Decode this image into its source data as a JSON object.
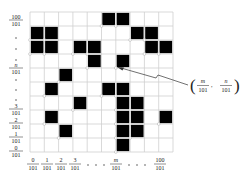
{
  "diagram": {
    "title": "",
    "grid": {
      "rows": 10,
      "cols": 10,
      "line_color": "#cfcfcf",
      "fill_color": "#000000"
    },
    "filled_cells": [
      [
        0,
        5
      ],
      [
        0,
        6
      ],
      [
        1,
        0
      ],
      [
        1,
        1
      ],
      [
        1,
        7
      ],
      [
        1,
        8
      ],
      [
        2,
        0
      ],
      [
        2,
        1
      ],
      [
        2,
        3
      ],
      [
        2,
        4
      ],
      [
        2,
        8
      ],
      [
        2,
        9
      ],
      [
        3,
        4
      ],
      [
        3,
        6
      ],
      [
        4,
        2
      ],
      [
        5,
        1
      ],
      [
        5,
        5
      ],
      [
        5,
        6
      ],
      [
        6,
        3
      ],
      [
        6,
        6
      ],
      [
        6,
        7
      ],
      [
        7,
        1
      ],
      [
        7,
        6
      ],
      [
        7,
        7
      ],
      [
        7,
        9
      ],
      [
        8,
        2
      ],
      [
        8,
        6
      ],
      [
        8,
        7
      ],
      [
        9,
        6
      ]
    ],
    "y_labels": [
      {
        "num": "100",
        "den": "101",
        "y": 20
      },
      {
        "dot": true,
        "y": 38
      },
      {
        "dot": true,
        "y": 49
      },
      {
        "dot": true,
        "y": 60
      },
      {
        "num": "n",
        "den": "101",
        "y": 68,
        "italic": true
      },
      {
        "dot": true,
        "y": 80
      },
      {
        "dot": true,
        "y": 90
      },
      {
        "dot": true,
        "y": 100
      },
      {
        "num": "3",
        "den": "101",
        "y": 109
      },
      {
        "num": "2",
        "den": "101",
        "y": 123
      },
      {
        "num": "1",
        "den": "101",
        "y": 137
      },
      {
        "num": "0",
        "den": "101",
        "y": 151
      }
    ],
    "x_labels": [
      {
        "num": "0",
        "den": "101",
        "x": 33
      },
      {
        "num": "1",
        "den": "101",
        "x": 47
      },
      {
        "num": "2",
        "den": "101",
        "x": 61
      },
      {
        "num": "3",
        "den": "101",
        "x": 75
      },
      {
        "dot": true,
        "x": 88
      },
      {
        "dot": true,
        "x": 96
      },
      {
        "dot": true,
        "x": 104
      },
      {
        "num": "m",
        "den": "101",
        "x": 116,
        "italic": true
      },
      {
        "dot": true,
        "x": 129
      },
      {
        "dot": true,
        "x": 137
      },
      {
        "dot": true,
        "x": 145
      },
      {
        "num": "100",
        "den": "101",
        "x": 160
      }
    ],
    "annotation": {
      "left_paren": "(",
      "right_paren": ")",
      "m_num": "m",
      "n_num": "n",
      "den": "101",
      "comma": ","
    }
  }
}
